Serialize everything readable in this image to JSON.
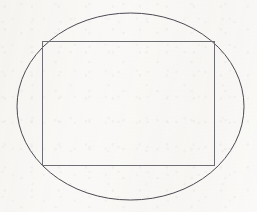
{
  "figure": {
    "kind": "geometry-diagram",
    "canvas": {
      "width": 257,
      "height": 212
    },
    "background_color": "#f9f8f6",
    "shapes": {
      "ellipse": {
        "name": "ellipse",
        "center_x": 130.5,
        "center_y": 106.5,
        "radius_x": 113.5,
        "radius_y": 93.5,
        "left": 17,
        "right": 244,
        "top": 13,
        "bottom": 200,
        "stroke_color": "#4a4a52",
        "stroke_width": 1,
        "fill": "none"
      },
      "rectangle": {
        "name": "inscribed-rectangle",
        "x": 42,
        "y": 41,
        "width": 173,
        "height": 125,
        "left": 42,
        "right": 215,
        "top": 41,
        "bottom": 166,
        "stroke_color": "#6d6d74",
        "stroke_width": 1,
        "fill": "none",
        "corners": [
          {
            "label": "top-left",
            "x": 42,
            "y": 41
          },
          {
            "label": "top-right",
            "x": 215,
            "y": 41
          },
          {
            "label": "bottom-right",
            "x": 215,
            "y": 166
          },
          {
            "label": "bottom-left",
            "x": 42,
            "y": 166
          }
        ]
      }
    },
    "labels": [],
    "annotations": []
  },
  "chart_data": {
    "type": "scatter",
    "xlabel": "",
    "ylabel": "",
    "xlim": [
      0,
      257
    ],
    "ylim": [
      0,
      212
    ],
    "grid": false,
    "legend": "none",
    "series": [
      {
        "name": "ellipse",
        "shape": "ellipse",
        "center": [
          130.5,
          106.5
        ],
        "radii": [
          113.5,
          93.5
        ]
      },
      {
        "name": "inscribed-rectangle",
        "shape": "polygon",
        "points": [
          [
            42,
            41
          ],
          [
            215,
            41
          ],
          [
            215,
            166
          ],
          [
            42,
            166
          ]
        ]
      }
    ]
  }
}
